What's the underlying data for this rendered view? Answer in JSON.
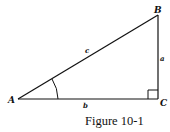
{
  "figure": {
    "caption": "Figure 10-1",
    "vertices": {
      "A": {
        "label": "A",
        "x": 18,
        "y": 99
      },
      "B": {
        "label": "B",
        "x": 158,
        "y": 15
      },
      "C": {
        "label": "C",
        "x": 158,
        "y": 99
      }
    },
    "sides": {
      "a": {
        "label": "a",
        "between": [
          "B",
          "C"
        ]
      },
      "b": {
        "label": "b",
        "between": [
          "A",
          "C"
        ]
      },
      "c": {
        "label": "c",
        "between": [
          "A",
          "B"
        ]
      }
    },
    "angle_mark": {
      "at": "A"
    },
    "right_angle": {
      "at": "C"
    },
    "stroke_color": "#111111",
    "background": "#ffffff"
  }
}
